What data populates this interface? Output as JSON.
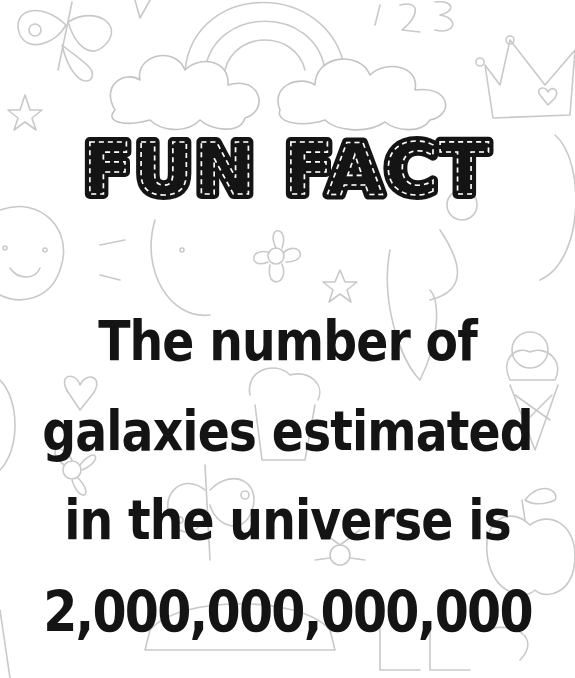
{
  "poster": {
    "title": "FUN FACT",
    "lines": [
      "The number of",
      "galaxies estimated",
      "in the universe is",
      "2,000,000,000,000"
    ]
  },
  "colors": {
    "text": "#141414",
    "background": "#ffffff",
    "doodle_stroke": "#c9c9c9"
  },
  "background_doodles": [
    "butterfly-icon",
    "rainbow-icon",
    "cloud-icon",
    "cloud-icon",
    "numbers-123-icon",
    "crown-icon",
    "star-icon",
    "sun-icon",
    "flower-icon",
    "heart-icon",
    "ice-cream-icon",
    "apple-icon",
    "cupcake-icon",
    "abc-letters-icon"
  ]
}
